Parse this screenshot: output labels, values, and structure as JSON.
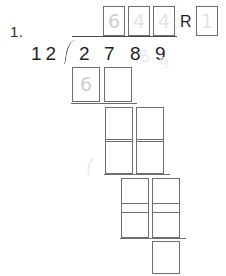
{
  "page": {
    "width": 226,
    "height": 276,
    "background": "#ffffff",
    "box_border_color": "#6e6e6e",
    "print_ink_color": "#1f1f1f",
    "pencil_color": "#cfcfcf"
  },
  "problem": {
    "number_label": "1.",
    "divisor": "12",
    "dividend_digits": [
      "2",
      "7",
      "8",
      "9"
    ],
    "remainder_label": "R",
    "operation": "long-division"
  },
  "quotient_row": {
    "boxes": [
      {
        "value": "6",
        "filled": true
      },
      {
        "value": "4",
        "filled": true
      },
      {
        "value": "4",
        "filled": true
      }
    ],
    "remainder_box": {
      "value": "1",
      "filled": true
    }
  },
  "work_rows": [
    {
      "name": "first-subtrahend",
      "boxes": [
        {
          "value": "6",
          "filled": true
        },
        {
          "value": "",
          "filled": false
        }
      ]
    },
    {
      "name": "first-difference",
      "boxes": [
        {
          "value": "",
          "filled": false
        },
        {
          "value": "",
          "filled": false
        }
      ]
    },
    {
      "name": "second-subtrahend",
      "boxes": [
        {
          "value": "",
          "filled": false
        },
        {
          "value": "",
          "filled": false
        }
      ]
    },
    {
      "name": "second-difference",
      "boxes": [
        {
          "value": "",
          "filled": false
        },
        {
          "value": "",
          "filled": false
        }
      ]
    },
    {
      "name": "third-subtrahend",
      "boxes": [
        {
          "value": "",
          "filled": false
        },
        {
          "value": "",
          "filled": false
        }
      ]
    },
    {
      "name": "final-remainder",
      "boxes": [
        {
          "value": "",
          "filled": false
        }
      ]
    }
  ],
  "smudges": [
    {
      "glyph": "8",
      "note": "erased pencil mark near dividend"
    },
    {
      "glyph": "9",
      "note": "erased pencil mark near dividend"
    },
    {
      "glyph": "(",
      "note": "erased pencil mark left of work area"
    }
  ]
}
